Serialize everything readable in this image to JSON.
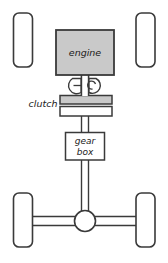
{
  "diagram": {
    "background_color": "#ffffff",
    "stroke_color": "#3a3a3a",
    "fill_gray": "#c9c9c9",
    "fill_white": "#ffffff",
    "components": {
      "engine": {
        "label": "engine",
        "fill": "#c9c9c9"
      },
      "clutch": {
        "label": "clutch",
        "plate_upper_fill": "#c9c9c9",
        "plate_lower_fill": "#ffffff"
      },
      "gearbox": {
        "label_line1": "gear",
        "label_line2": "box",
        "fill": "#ffffff"
      },
      "differential": {
        "label": "",
        "fill": "#ffffff"
      }
    },
    "wheels": [
      {
        "name": "front-left-wheel"
      },
      {
        "name": "front-right-wheel"
      },
      {
        "name": "rear-left-wheel"
      },
      {
        "name": "rear-right-wheel"
      }
    ]
  }
}
